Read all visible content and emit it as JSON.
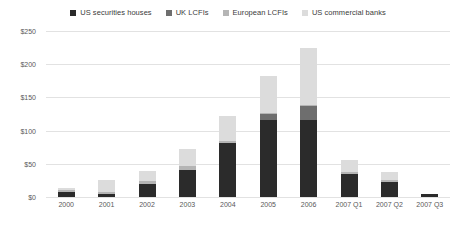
{
  "chart_data": {
    "type": "bar",
    "subtype": "stacked-column",
    "title": "",
    "subtitle": "",
    "xlabel": "",
    "ylabel": "",
    "categories": [
      "2000",
      "2001",
      "2002",
      "2003",
      "2004",
      "2005",
      "2006",
      "2007 Q1",
      "2007 Q2",
      "2007 Q3"
    ],
    "ylim": [
      0,
      250
    ],
    "ytick_values": [
      0,
      50,
      100,
      150,
      200,
      250
    ],
    "ytick_labels": [
      "$0",
      "$50",
      "$100",
      "$150",
      "$200",
      "$250"
    ],
    "grid": true,
    "grid_axis": "y",
    "legend_position": "top-center",
    "series": [
      {
        "name": "US securities houses",
        "color": "#2b2b2b",
        "values": [
          8,
          4,
          20,
          41,
          81,
          116,
          116,
          35,
          22,
          4
        ]
      },
      {
        "name": "UK LCFIs",
        "color": "#6e6e6e",
        "values": [
          0,
          0,
          0,
          0,
          0,
          9,
          21,
          0,
          0,
          1
        ]
      },
      {
        "name": "European LCFIs",
        "color": "#b5b5b5",
        "values": [
          2,
          3,
          4,
          5,
          4,
          2,
          2,
          3,
          3,
          0
        ]
      },
      {
        "name": "US commercial banks",
        "color": "#dcdcdc",
        "values": [
          3,
          18,
          15,
          26,
          37,
          55,
          85,
          18,
          13,
          0
        ]
      }
    ],
    "totals": [
      13,
      25,
      39,
      72,
      122,
      182,
      224,
      56,
      38,
      5
    ]
  },
  "legend": {
    "items": [
      {
        "label": "US securities houses",
        "color": "#2b2b2b"
      },
      {
        "label": "UK LCFIs",
        "color": "#6e6e6e"
      },
      {
        "label": "European LCFIs",
        "color": "#b5b5b5"
      },
      {
        "label": "US commercial banks",
        "color": "#dcdcdc"
      }
    ]
  },
  "axes": {
    "y": {
      "labels": [
        "$250",
        "$200",
        "$150",
        "$100",
        "$50",
        "$0"
      ],
      "values": [
        250,
        200,
        150,
        100,
        50,
        0
      ]
    },
    "x": {
      "labels": [
        "2000",
        "2001",
        "2002",
        "2003",
        "2004",
        "2005",
        "2006",
        "2007 Q1",
        "2007 Q2",
        "2007 Q3"
      ]
    }
  },
  "style": {
    "background": "#ffffff",
    "gridline_color": "#e2e2e2",
    "tick_text_color": "#595959",
    "legend_text_color": "#3b3b3b"
  }
}
